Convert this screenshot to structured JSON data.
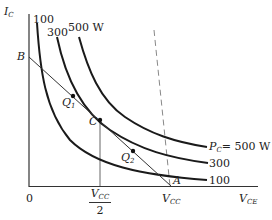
{
  "diagram": {
    "axes": {
      "y_label": "I",
      "y_label_sub": "C",
      "x_label": "V",
      "x_label_sub": "CE",
      "origin_label": "0"
    },
    "x_ticks": {
      "half_vcc_num": "V",
      "half_vcc_num_sub": "CC",
      "half_vcc_den": "2",
      "vcc": "V",
      "vcc_sub": "CC"
    },
    "points": {
      "B": "B",
      "A": "A",
      "C": "C",
      "Q1": "Q",
      "Q1_sub": "1",
      "Q2": "Q",
      "Q2_sub": "2"
    },
    "curves": [
      {
        "id": "p100",
        "top_label": "100",
        "right_label": "100"
      },
      {
        "id": "p300",
        "top_label": "300",
        "right_label": "300"
      },
      {
        "id": "p500",
        "top_label": "500 W",
        "right_label_prefix": "P",
        "right_label_sub": "C",
        "right_label": "= 500 W"
      }
    ],
    "colors": {
      "curve": "#1a1a1a",
      "axis": "#333333",
      "dashed": "#888888"
    }
  }
}
